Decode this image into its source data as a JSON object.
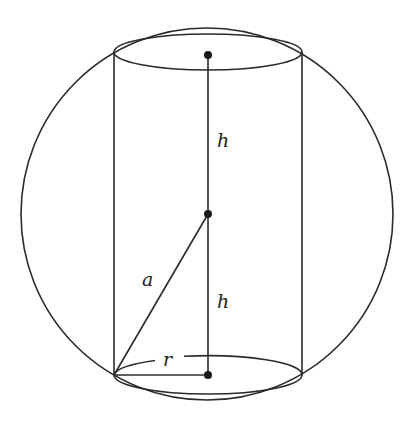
{
  "diagram": {
    "labels": {
      "h_upper": "h",
      "h_lower": "h",
      "a": "a",
      "r": "r"
    },
    "colors": {
      "stroke": "#2a2a2a",
      "background": "#ffffff"
    }
  }
}
